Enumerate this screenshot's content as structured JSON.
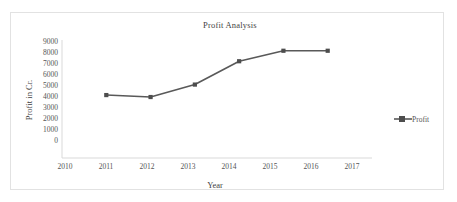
{
  "chart_data": {
    "type": "line",
    "title": "Profit Analysis",
    "xlabel": "Year",
    "ylabel": "Profit in Cr.",
    "x": [
      2011,
      2012,
      2013,
      2014,
      2015,
      2016
    ],
    "values": [
      4800,
      4650,
      5600,
      7380,
      8180,
      8180
    ],
    "series": [
      {
        "name": "Profit",
        "values": [
          4800,
          4650,
          5600,
          7380,
          8180,
          8180
        ]
      }
    ],
    "categories": [
      "2011",
      "2012",
      "2013",
      "2014",
      "2015",
      "2016"
    ],
    "xticks": [
      "2010",
      "2011",
      "2012",
      "2013",
      "2014",
      "2015",
      "2016",
      "2017"
    ],
    "yticks": [
      "0",
      "1000",
      "2000",
      "3000",
      "4000",
      "5000",
      "6000",
      "7000",
      "8000",
      "9000"
    ],
    "xlim": [
      2010,
      2017
    ],
    "ylim": [
      0,
      9000
    ],
    "grid": false,
    "legend": {
      "position": "right",
      "entries": [
        "Profit"
      ]
    },
    "colors": {
      "series_line": "#595959",
      "marker": "#4d4d4d",
      "axis": "#d9d9d9",
      "text": "#3f3f3f",
      "tick_text": "#555555",
      "frame_border": "#e2e2e2",
      "background": "#ffffff"
    }
  },
  "legend": {
    "profit_label": "Profit"
  },
  "icons": {
    "legend_marker": "square-marker-icon"
  }
}
